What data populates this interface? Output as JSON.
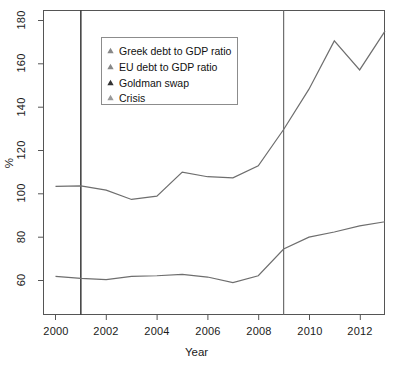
{
  "chart_data": {
    "type": "line",
    "title": "",
    "xlabel": "Year",
    "ylabel": "%",
    "xlim": [
      2000,
      2013
    ],
    "ylim": [
      52,
      182
    ],
    "grid": false,
    "legend_position": "top-left-inside",
    "x": [
      2000,
      2001,
      2002,
      2003,
      2004,
      2005,
      2006,
      2007,
      2008,
      2009,
      2010,
      2011,
      2012,
      2013
    ],
    "xticks": [
      "2000",
      "2002",
      "2004",
      "2006",
      "2008",
      "2010",
      "2012"
    ],
    "xtick_values": [
      2000,
      2002,
      2004,
      2006,
      2008,
      2010,
      2012
    ],
    "yticks": [
      "60",
      "80",
      "100",
      "120",
      "140",
      "160",
      "180"
    ],
    "ytick_values": [
      60,
      80,
      100,
      120,
      140,
      160,
      180
    ],
    "series": [
      {
        "name": "Greek debt to GDP ratio",
        "color": "#6e6e6e",
        "marker": "triangle",
        "values": [
          103.4,
          103.7,
          101.7,
          97.4,
          98.9,
          110.0,
          107.9,
          107.4,
          112.9,
          129.7,
          148.3,
          170.6,
          157.2,
          175.1
        ]
      },
      {
        "name": "EU debt to GDP ratio",
        "color": "#6e6e6e",
        "marker": "triangle",
        "values": [
          61.9,
          61.0,
          60.4,
          61.9,
          62.2,
          62.8,
          61.6,
          59.0,
          62.2,
          74.5,
          80.0,
          82.4,
          85.2,
          87.1
        ]
      }
    ],
    "annotations": [
      {
        "name": "Goldman swap",
        "type": "vertical-line",
        "x": 2001,
        "color": "#2b2b2b",
        "marker": "triangle"
      },
      {
        "name": "Crisis",
        "type": "vertical-line",
        "x": 2009,
        "color": "#6e6e6e",
        "marker": "triangle"
      }
    ]
  },
  "legend": {
    "items": [
      {
        "label": "Greek debt to GDP ratio",
        "marker_color": "#888888"
      },
      {
        "label": "EU debt to GDP ratio",
        "marker_color": "#888888"
      },
      {
        "label": "Goldman swap",
        "marker_color": "#333333"
      },
      {
        "label": "Crisis",
        "marker_color": "#9a9a9a"
      }
    ]
  },
  "axes": {
    "x_title": "Year",
    "y_title": "%",
    "x_tick_labels": [
      "2000",
      "2002",
      "2004",
      "2006",
      "2008",
      "2010",
      "2012"
    ],
    "y_tick_labels": [
      "60",
      "80",
      "100",
      "120",
      "140",
      "160",
      "180"
    ]
  },
  "colors": {
    "line": "#6e6e6e",
    "event_dark": "#2b2b2b",
    "event_light": "#6e6e6e",
    "axis": "#4d4d4d",
    "background": "#ffffff"
  }
}
